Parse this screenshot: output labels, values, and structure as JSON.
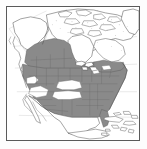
{
  "figure": {
    "kind": "distribution-range-map",
    "region": "North America",
    "frame": {
      "visible": true,
      "border_color": "#5a5a5a",
      "background_color": "#ffffff"
    },
    "legend_visible": false,
    "labels_visible": false,
    "title": "",
    "colors": {
      "range_fill": "#8a8a8a",
      "range_fill_dark": "#7b7b7b",
      "non_range_fill": "#ffffff",
      "coastline": "#4a4a4a",
      "internal_border": "#6e6e6e",
      "water": "#ffffff",
      "stipple": "#9a9a9a"
    },
    "shaded_areas": [
      "contiguous United States (most states)",
      "southern British Columbia",
      "Alberta",
      "Saskatchewan",
      "southern Manitoba",
      "southern Ontario",
      "southern Quebec",
      "Maritime provinces"
    ],
    "unshaded_areas": [
      "Alaska",
      "Yukon",
      "Northwest Territories",
      "Nunavut",
      "Hudson Bay region",
      "Labrador",
      "Greenland",
      "Mexico",
      "Central America",
      "Cuba",
      "Hispaniola",
      "Bahamas",
      "central Great Plains gap",
      "southwestern desert gap"
    ]
  },
  "map_geometry": {
    "graticule": {
      "visible": true,
      "color": "#b8b8b8"
    },
    "notes": "grayscale species range map, no axis ticks, no text labels"
  }
}
